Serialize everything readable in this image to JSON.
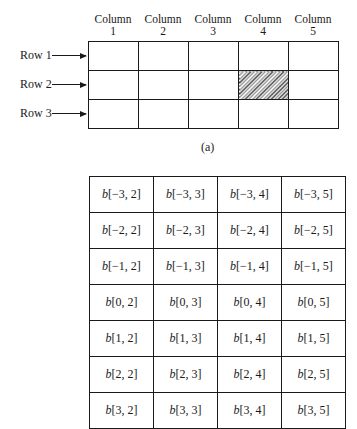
{
  "diagram_a": {
    "column_labels": [
      {
        "line1": "Column",
        "line2": "1"
      },
      {
        "line1": "Column",
        "line2": "2"
      },
      {
        "line1": "Column",
        "line2": "3"
      },
      {
        "line1": "Column",
        "line2": "4"
      },
      {
        "line1": "Column",
        "line2": "5"
      }
    ],
    "row_labels": [
      "Row 1",
      "Row 2",
      "Row 3"
    ],
    "rows": 3,
    "columns": 5,
    "highlighted_cell": {
      "row": 2,
      "column": 4,
      "style": "hatched"
    },
    "caption": "(a)"
  },
  "diagram_b": {
    "var": "b",
    "cells": [
      [
        "[−3, 2]",
        "[−3, 3]",
        "[−3, 4]",
        "[−3, 5]"
      ],
      [
        "[−2, 2]",
        "[−2, 3]",
        "[−2, 4]",
        "[−2, 5]"
      ],
      [
        "[−1, 2]",
        "[−1, 3]",
        "[−1, 4]",
        "[−1, 5]"
      ],
      [
        "[0, 2]",
        "[0, 3]",
        "[0, 4]",
        "[0, 5]"
      ],
      [
        "[1, 2]",
        "[1, 3]",
        "[1, 4]",
        "[1, 5]"
      ],
      [
        "[2, 2]",
        "[2, 3]",
        "[2, 4]",
        "[2, 5]"
      ],
      [
        "[3, 2]",
        "[3, 3]",
        "[3, 4]",
        "[3, 5]"
      ]
    ]
  }
}
